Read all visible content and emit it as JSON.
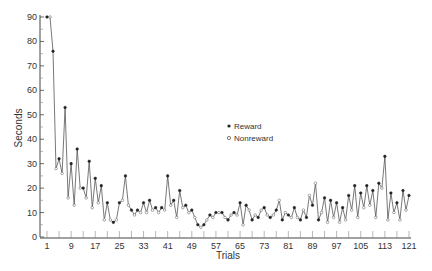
{
  "chart_data": {
    "type": "line",
    "title": "",
    "xlabel": "Trials",
    "ylabel": "Seconds",
    "xlim": [
      1,
      121
    ],
    "ylim": [
      0,
      90
    ],
    "grid": false,
    "x_ticks": [
      1,
      9,
      17,
      25,
      33,
      41,
      49,
      57,
      65,
      73,
      81,
      89,
      97,
      105,
      113,
      121
    ],
    "y_ticks": [
      0,
      10,
      20,
      30,
      40,
      50,
      60,
      70,
      80,
      90
    ],
    "legend": {
      "position": "center-right",
      "entries": [
        {
          "label": "Reward",
          "marker": "filled-circle"
        },
        {
          "label": "Nonreward",
          "marker": "open-circle"
        }
      ]
    },
    "colors": {
      "line": "#555555",
      "axis": "#444444",
      "marker_fill": "#222222",
      "marker_open": "#ffffff"
    },
    "series": [
      {
        "name": "Latency",
        "x": [
          1,
          2,
          3,
          4,
          5,
          6,
          7,
          8,
          9,
          10,
          11,
          12,
          13,
          14,
          15,
          16,
          17,
          18,
          19,
          20,
          21,
          22,
          23,
          24,
          25,
          26,
          27,
          28,
          29,
          30,
          31,
          32,
          33,
          34,
          35,
          36,
          37,
          38,
          39,
          40,
          41,
          42,
          43,
          44,
          45,
          46,
          47,
          48,
          49,
          50,
          51,
          52,
          53,
          54,
          55,
          56,
          57,
          58,
          59,
          60,
          61,
          62,
          63,
          64,
          65,
          66,
          67,
          68,
          69,
          70,
          71,
          72,
          73,
          74,
          75,
          76,
          77,
          78,
          79,
          80,
          81,
          82,
          83,
          84,
          85,
          86,
          87,
          88,
          89,
          90,
          91,
          92,
          93,
          94,
          95,
          96,
          97,
          98,
          99,
          100,
          101,
          102,
          103,
          104,
          105,
          106,
          107,
          108,
          109,
          110,
          111,
          112,
          113,
          114,
          115,
          116,
          117,
          118,
          119,
          120,
          121
        ],
        "y": [
          90,
          90,
          76,
          28,
          32,
          26,
          53,
          16,
          30,
          13,
          36,
          20,
          20,
          16,
          31,
          12,
          24,
          14,
          21,
          7,
          14,
          7,
          6,
          7,
          14,
          15,
          25,
          13,
          11,
          9,
          11,
          10,
          14,
          10,
          15,
          11,
          12,
          10,
          12,
          11,
          25,
          13,
          15,
          8,
          19,
          12,
          13,
          10,
          11,
          8,
          5,
          4,
          5,
          7,
          9,
          8,
          10,
          10,
          10,
          8,
          7,
          9,
          10,
          9,
          14,
          5,
          13,
          11,
          7,
          9,
          8,
          11,
          12,
          9,
          8,
          9,
          11,
          15,
          7,
          10,
          9,
          8,
          12,
          8,
          7,
          11,
          8,
          17,
          13,
          22,
          7,
          10,
          16,
          6,
          15,
          8,
          14,
          6,
          12,
          7,
          17,
          11,
          21,
          8,
          18,
          12,
          21,
          13,
          19,
          8,
          22,
          20,
          33,
          7,
          18,
          10,
          14,
          7,
          19,
          11,
          17
        ],
        "reward": [
          1,
          0,
          1,
          0,
          1,
          0,
          1,
          0,
          1,
          0,
          1,
          0,
          1,
          0,
          1,
          0,
          1,
          0,
          1,
          0,
          1,
          0,
          1,
          0,
          1,
          0,
          1,
          0,
          1,
          0,
          1,
          0,
          1,
          0,
          1,
          0,
          1,
          0,
          1,
          0,
          1,
          0,
          1,
          0,
          1,
          0,
          1,
          0,
          1,
          0,
          1,
          0,
          1,
          0,
          1,
          0,
          1,
          0,
          1,
          0,
          1,
          0,
          1,
          0,
          1,
          0,
          1,
          0,
          1,
          0,
          1,
          0,
          1,
          0,
          1,
          0,
          1,
          0,
          1,
          0,
          1,
          0,
          1,
          0,
          1,
          0,
          1,
          0,
          1,
          0,
          1,
          0,
          1,
          0,
          1,
          0,
          1,
          0,
          1,
          0,
          1,
          0,
          1,
          0,
          1,
          0,
          1,
          0,
          1,
          0,
          1,
          0,
          1,
          0,
          1,
          0,
          1,
          0,
          1,
          0,
          1
        ]
      }
    ]
  },
  "labels": {
    "xlabel": "Trials",
    "ylabel": "Seconds",
    "legend_reward": "Reward",
    "legend_nonreward": "Nonreward"
  }
}
